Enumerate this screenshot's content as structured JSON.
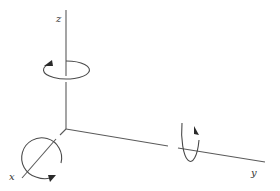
{
  "diagram": {
    "type": "3d-coordinate-axes-with-rotations",
    "colors": {
      "line": "#5a5a5a",
      "arrow": "#2a2a2a",
      "text": "#333333",
      "background": "#ffffff"
    },
    "origin": [
      66,
      129
    ],
    "axes": [
      {
        "id": "z",
        "label": "z",
        "direction": "up",
        "end": [
          66,
          10
        ],
        "label_pos": [
          56,
          22
        ]
      },
      {
        "id": "y",
        "label": "y",
        "direction": "right",
        "end": [
          265,
          162
        ],
        "label_pos": [
          251,
          176
        ]
      },
      {
        "id": "x",
        "label": "x",
        "direction": "down-left",
        "end": [
          22,
          178
        ],
        "label_pos": [
          9,
          180
        ]
      }
    ],
    "rotations": [
      {
        "axis": "z",
        "shape": "ellipse",
        "center": [
          66,
          70
        ],
        "rx": 23,
        "ry": 9,
        "arrow_direction": "counter-clockwise-from-above"
      },
      {
        "axis": "y",
        "shape": "ellipse",
        "center": [
          180,
          150
        ],
        "rx": 8,
        "ry": 27,
        "arrow_direction": "up"
      },
      {
        "axis": "x",
        "shape": "circle",
        "center": [
          42,
          158
        ],
        "r": 20,
        "arrow_direction": "right-at-bottom"
      }
    ]
  }
}
